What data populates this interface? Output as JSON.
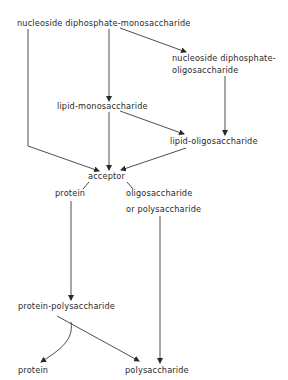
{
  "diagram": {
    "type": "biosynthesis-pathway",
    "nodes": {
      "ndp_mono": "nucleoside diphosphate-monosaccharide",
      "ndp_oligo_line1": "nucleoside diphosphate-",
      "ndp_oligo_line2": "oligosaccharide",
      "lipid_mono": "lipid-monosaccharide",
      "lipid_oligo": "lipid-oligosaccharide",
      "acceptor": "acceptor",
      "protein_branch": "protein",
      "oligo_branch_line1": "oligosaccharide",
      "oligo_branch_line2": "or polysaccharide",
      "protein_poly": "protein-polysaccharide",
      "protein_out": "protein",
      "poly_out": "polysaccharide"
    },
    "edges": [
      {
        "from": "nucleoside diphosphate-monosaccharide",
        "to": "nucleoside diphosphate-oligosaccharide"
      },
      {
        "from": "nucleoside diphosphate-monosaccharide",
        "to": "lipid-monosaccharide"
      },
      {
        "from": "nucleoside diphosphate-monosaccharide",
        "to": "acceptor"
      },
      {
        "from": "nucleoside diphosphate-oligosaccharide",
        "to": "lipid-oligosaccharide"
      },
      {
        "from": "lipid-monosaccharide",
        "to": "lipid-oligosaccharide"
      },
      {
        "from": "lipid-monosaccharide",
        "to": "acceptor"
      },
      {
        "from": "lipid-oligosaccharide",
        "to": "acceptor"
      },
      {
        "from": "acceptor",
        "to": "protein"
      },
      {
        "from": "acceptor",
        "to": "oligosaccharide or polysaccharide"
      },
      {
        "from": "protein",
        "to": "protein-polysaccharide"
      },
      {
        "from": "oligosaccharide or polysaccharide",
        "to": "polysaccharide"
      },
      {
        "from": "protein-polysaccharide",
        "to": "protein"
      },
      {
        "from": "protein-polysaccharide",
        "to": "polysaccharide"
      }
    ]
  }
}
